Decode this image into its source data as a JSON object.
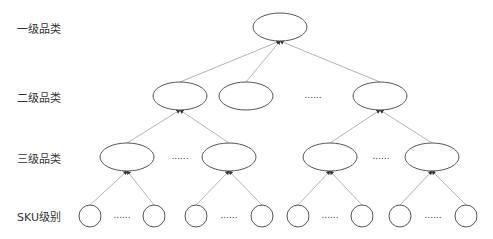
{
  "diagram": {
    "type": "tree",
    "levels": [
      {
        "label": "一级品类",
        "y": 27
      },
      {
        "label": "二级品类",
        "y": 96
      },
      {
        "label": "三级品类",
        "y": 157
      },
      {
        "label": "SKU级别",
        "y": 215
      }
    ],
    "ellipsis": "......",
    "colors": {
      "stroke": "#555555",
      "edge": "#aaaaaa",
      "text": "#333333"
    },
    "nodes": {
      "root": {
        "cx": 280,
        "cy": 27
      },
      "level2": [
        {
          "cx": 180,
          "cy": 96
        },
        {
          "cx": 246,
          "cy": 96
        },
        {
          "cx": 380,
          "cy": 96
        }
      ],
      "level3": [
        {
          "cx": 127,
          "cy": 157
        },
        {
          "cx": 229,
          "cy": 157
        },
        {
          "cx": 330,
          "cy": 157
        },
        {
          "cx": 432,
          "cy": 157
        }
      ],
      "sku": [
        90,
        154,
        196,
        262,
        298,
        362,
        400,
        466
      ]
    }
  }
}
